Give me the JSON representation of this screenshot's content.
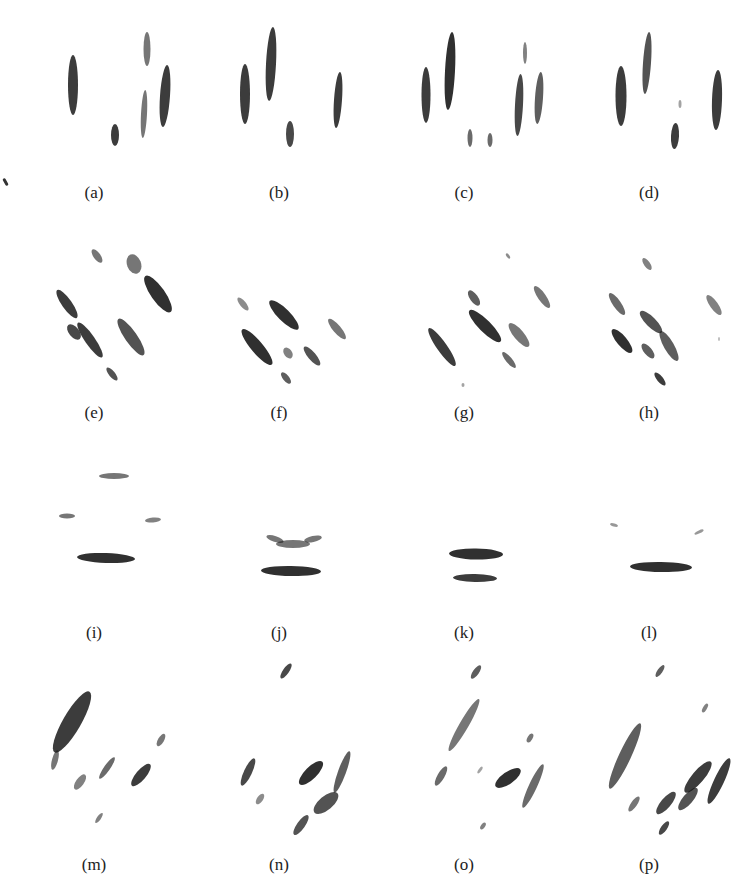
{
  "figure": {
    "panel_width": 184,
    "blob_color": "#1a1a1a",
    "panels": [
      {
        "label": "(a)",
        "col": 0,
        "row": 0,
        "caption_y": 183,
        "blobs": [
          {
            "cx": 63,
            "cy": 85,
            "rx": 5,
            "ry": 30,
            "rot": 0,
            "op": 0.85
          },
          {
            "cx": 105,
            "cy": 135,
            "rx": 4,
            "ry": 11,
            "rot": 0,
            "op": 0.85
          },
          {
            "cx": 137,
            "cy": 49,
            "rx": 3.5,
            "ry": 17,
            "rot": 0,
            "op": 0.6
          },
          {
            "cx": 134,
            "cy": 114,
            "rx": 3,
            "ry": 24,
            "rot": 3,
            "op": 0.6
          },
          {
            "cx": 155,
            "cy": 96,
            "rx": 5,
            "ry": 31,
            "rot": 4,
            "op": 0.85
          }
        ]
      },
      {
        "label": "(b)",
        "col": 1,
        "row": 0,
        "caption_y": 183,
        "blobs": [
          {
            "cx": 50,
            "cy": 94,
            "rx": 5,
            "ry": 30,
            "rot": 0,
            "op": 0.85
          },
          {
            "cx": 76,
            "cy": 64,
            "rx": 5,
            "ry": 37,
            "rot": 3,
            "op": 0.85
          },
          {
            "cx": 95,
            "cy": 134,
            "rx": 4,
            "ry": 13,
            "rot": 0,
            "op": 0.8
          },
          {
            "cx": 143,
            "cy": 100,
            "rx": 4,
            "ry": 28,
            "rot": 4,
            "op": 0.85
          }
        ]
      },
      {
        "label": "(c)",
        "col": 2,
        "row": 0,
        "caption_y": 183,
        "blobs": [
          {
            "cx": 46,
            "cy": 95,
            "rx": 4.5,
            "ry": 28,
            "rot": 0,
            "op": 0.85
          },
          {
            "cx": 70,
            "cy": 71,
            "rx": 5,
            "ry": 39,
            "rot": 3,
            "op": 0.9
          },
          {
            "cx": 90,
            "cy": 138,
            "rx": 2.5,
            "ry": 9,
            "rot": 0,
            "op": 0.65
          },
          {
            "cx": 110,
            "cy": 140,
            "rx": 2.5,
            "ry": 7,
            "rot": 0,
            "op": 0.65
          },
          {
            "cx": 145,
            "cy": 53,
            "rx": 2,
            "ry": 11,
            "rot": 0,
            "op": 0.55
          },
          {
            "cx": 139,
            "cy": 105,
            "rx": 4,
            "ry": 31,
            "rot": 3,
            "op": 0.8
          },
          {
            "cx": 159,
            "cy": 98,
            "rx": 4,
            "ry": 26,
            "rot": 4,
            "op": 0.7
          }
        ]
      },
      {
        "label": "(d)",
        "col": 3,
        "row": 0,
        "caption_y": 183,
        "blobs": [
          {
            "cx": 56,
            "cy": 96,
            "rx": 5.5,
            "ry": 30,
            "rot": 0,
            "op": 0.85
          },
          {
            "cx": 82,
            "cy": 63,
            "rx": 4,
            "ry": 31,
            "rot": 4,
            "op": 0.75
          },
          {
            "cx": 110,
            "cy": 136,
            "rx": 4,
            "ry": 13,
            "rot": 3,
            "op": 0.85
          },
          {
            "cx": 115,
            "cy": 104,
            "rx": 1.5,
            "ry": 4,
            "rot": 0,
            "op": 0.4
          },
          {
            "cx": 152,
            "cy": 100,
            "rx": 5,
            "ry": 30,
            "rot": 2,
            "op": 0.85
          }
        ]
      },
      {
        "label": "(e)",
        "col": 0,
        "row": 1,
        "caption_y": 403,
        "blobs": [
          {
            "cx": 87,
            "cy": 34,
            "rx": 3.5,
            "ry": 8,
            "rot": -35,
            "op": 0.6
          },
          {
            "cx": 124,
            "cy": 42,
            "rx": 7,
            "ry": 10,
            "rot": -20,
            "op": 0.6
          },
          {
            "cx": 148,
            "cy": 72,
            "rx": 7,
            "ry": 22,
            "rot": -35,
            "op": 0.9
          },
          {
            "cx": 57,
            "cy": 82,
            "rx": 5,
            "ry": 17,
            "rot": -35,
            "op": 0.85
          },
          {
            "cx": 80,
            "cy": 118,
            "rx": 5,
            "ry": 21,
            "rot": -35,
            "op": 0.85
          },
          {
            "cx": 64,
            "cy": 110,
            "rx": 5,
            "ry": 9,
            "rot": -40,
            "op": 0.8
          },
          {
            "cx": 121,
            "cy": 115,
            "rx": 6,
            "ry": 22,
            "rot": -35,
            "op": 0.75
          },
          {
            "cx": 102,
            "cy": 152,
            "rx": 3,
            "ry": 8,
            "rot": -40,
            "op": 0.75
          }
        ]
      },
      {
        "label": "(f)",
        "col": 1,
        "row": 1,
        "caption_y": 403,
        "blobs": [
          {
            "cx": 48,
            "cy": 82,
            "rx": 3,
            "ry": 8,
            "rot": -40,
            "op": 0.5
          },
          {
            "cx": 89,
            "cy": 93,
            "rx": 6,
            "ry": 20,
            "rot": -45,
            "op": 0.9
          },
          {
            "cx": 142,
            "cy": 107,
            "rx": 4,
            "ry": 13,
            "rot": -40,
            "op": 0.6
          },
          {
            "cx": 62,
            "cy": 125,
            "rx": 6,
            "ry": 23,
            "rot": -40,
            "op": 0.9
          },
          {
            "cx": 93,
            "cy": 131,
            "rx": 4,
            "ry": 6,
            "rot": -35,
            "op": 0.55
          },
          {
            "cx": 117,
            "cy": 134,
            "rx": 4,
            "ry": 12,
            "rot": -40,
            "op": 0.75
          },
          {
            "cx": 91,
            "cy": 156,
            "rx": 3,
            "ry": 7,
            "rot": -40,
            "op": 0.7
          }
        ]
      },
      {
        "label": "(g)",
        "col": 2,
        "row": 1,
        "caption_y": 403,
        "blobs": [
          {
            "cx": 128,
            "cy": 34,
            "rx": 1.5,
            "ry": 3,
            "rot": -35,
            "op": 0.5
          },
          {
            "cx": 94,
            "cy": 76,
            "rx": 4,
            "ry": 9,
            "rot": -35,
            "op": 0.7
          },
          {
            "cx": 105,
            "cy": 104,
            "rx": 6,
            "ry": 22,
            "rot": -45,
            "op": 0.9
          },
          {
            "cx": 162,
            "cy": 75,
            "rx": 4,
            "ry": 13,
            "rot": -35,
            "op": 0.6
          },
          {
            "cx": 62,
            "cy": 125,
            "rx": 5,
            "ry": 23,
            "rot": -35,
            "op": 0.85
          },
          {
            "cx": 139,
            "cy": 113,
            "rx": 5,
            "ry": 15,
            "rot": -40,
            "op": 0.6
          },
          {
            "cx": 129,
            "cy": 138,
            "rx": 3,
            "ry": 10,
            "rot": -40,
            "op": 0.65
          },
          {
            "cx": 83,
            "cy": 163,
            "rx": 1.5,
            "ry": 2,
            "rot": 0,
            "op": 0.4
          }
        ]
      },
      {
        "label": "(h)",
        "col": 3,
        "row": 1,
        "caption_y": 403,
        "blobs": [
          {
            "cx": 82,
            "cy": 42,
            "rx": 3,
            "ry": 7,
            "rot": -35,
            "op": 0.55
          },
          {
            "cx": 52,
            "cy": 82,
            "rx": 4,
            "ry": 13,
            "rot": -35,
            "op": 0.65
          },
          {
            "cx": 149,
            "cy": 83,
            "rx": 4,
            "ry": 12,
            "rot": -35,
            "op": 0.55
          },
          {
            "cx": 86,
            "cy": 100,
            "rx": 5,
            "ry": 15,
            "rot": -45,
            "op": 0.75
          },
          {
            "cx": 104,
            "cy": 124,
            "rx": 5,
            "ry": 17,
            "rot": -30,
            "op": 0.7
          },
          {
            "cx": 57,
            "cy": 119,
            "rx": 5,
            "ry": 15,
            "rot": -40,
            "op": 0.9
          },
          {
            "cx": 83,
            "cy": 129,
            "rx": 4,
            "ry": 9,
            "rot": -40,
            "op": 0.7
          },
          {
            "cx": 95,
            "cy": 157,
            "rx": 3,
            "ry": 8,
            "rot": -40,
            "op": 0.85
          },
          {
            "cx": 154,
            "cy": 117,
            "rx": 1,
            "ry": 2,
            "rot": 0,
            "op": 0.3
          }
        ]
      },
      {
        "label": "(i)",
        "col": 0,
        "row": 2,
        "caption_y": 623,
        "blobs": [
          {
            "cx": 104,
            "cy": 34,
            "rx": 15,
            "ry": 3,
            "rot": 0,
            "op": 0.6
          },
          {
            "cx": 57,
            "cy": 74,
            "rx": 8,
            "ry": 2.5,
            "rot": 0,
            "op": 0.6
          },
          {
            "cx": 143,
            "cy": 78,
            "rx": 8,
            "ry": 2.5,
            "rot": -5,
            "op": 0.55
          },
          {
            "cx": 96,
            "cy": 116,
            "rx": 29,
            "ry": 5,
            "rot": 2,
            "op": 0.9
          }
        ]
      },
      {
        "label": "(j)",
        "col": 1,
        "row": 2,
        "caption_y": 623,
        "blobs": [
          {
            "cx": 98,
            "cy": 102,
            "rx": 17,
            "ry": 4,
            "rot": 0,
            "op": 0.6
          },
          {
            "cx": 80,
            "cy": 97,
            "rx": 9,
            "ry": 3,
            "rot": 18,
            "op": 0.6
          },
          {
            "cx": 118,
            "cy": 97,
            "rx": 9,
            "ry": 3,
            "rot": -12,
            "op": 0.6
          },
          {
            "cx": 96,
            "cy": 129,
            "rx": 30,
            "ry": 5,
            "rot": 1,
            "op": 0.9
          }
        ]
      },
      {
        "label": "(k)",
        "col": 2,
        "row": 2,
        "caption_y": 623,
        "blobs": [
          {
            "cx": 96,
            "cy": 112,
            "rx": 27,
            "ry": 5.5,
            "rot": 1,
            "op": 0.9
          },
          {
            "cx": 95,
            "cy": 136,
            "rx": 22,
            "ry": 4,
            "rot": 1,
            "op": 0.85
          }
        ]
      },
      {
        "label": "(l)",
        "col": 3,
        "row": 2,
        "caption_y": 623,
        "blobs": [
          {
            "cx": 49,
            "cy": 83,
            "rx": 4,
            "ry": 1.5,
            "rot": 15,
            "op": 0.45
          },
          {
            "cx": 134,
            "cy": 90,
            "rx": 5,
            "ry": 1.5,
            "rot": -25,
            "op": 0.45
          },
          {
            "cx": 96,
            "cy": 125,
            "rx": 31,
            "ry": 5,
            "rot": 1,
            "op": 0.9
          }
        ]
      },
      {
        "label": "(m)",
        "col": 0,
        "row": 3,
        "caption_y": 855,
        "blobs": [
          {
            "cx": 62,
            "cy": 57,
            "rx": 9,
            "ry": 35,
            "rot": 30,
            "op": 0.85
          },
          {
            "cx": 45,
            "cy": 95,
            "rx": 3,
            "ry": 10,
            "rot": 15,
            "op": 0.6
          },
          {
            "cx": 151,
            "cy": 75,
            "rx": 3,
            "ry": 7,
            "rot": 30,
            "op": 0.6
          },
          {
            "cx": 97,
            "cy": 103,
            "rx": 3,
            "ry": 13,
            "rot": 35,
            "op": 0.65
          },
          {
            "cx": 131,
            "cy": 110,
            "rx": 5,
            "ry": 14,
            "rot": 40,
            "op": 0.85
          },
          {
            "cx": 70,
            "cy": 117,
            "rx": 4,
            "ry": 9,
            "rot": 35,
            "op": 0.55
          },
          {
            "cx": 89,
            "cy": 153,
            "rx": 2,
            "ry": 6,
            "rot": 35,
            "op": 0.55
          }
        ]
      },
      {
        "label": "(n)",
        "col": 1,
        "row": 3,
        "caption_y": 855,
        "blobs": [
          {
            "cx": 91,
            "cy": 6,
            "rx": 3,
            "ry": 9,
            "rot": 35,
            "op": 0.8
          },
          {
            "cx": 53,
            "cy": 107,
            "rx": 4,
            "ry": 15,
            "rot": 25,
            "op": 0.8
          },
          {
            "cx": 116,
            "cy": 108,
            "rx": 6,
            "ry": 16,
            "rot": 45,
            "op": 0.9
          },
          {
            "cx": 147,
            "cy": 107,
            "rx": 4,
            "ry": 22,
            "rot": 20,
            "op": 0.7
          },
          {
            "cx": 131,
            "cy": 138,
            "rx": 7,
            "ry": 15,
            "rot": 50,
            "op": 0.75
          },
          {
            "cx": 65,
            "cy": 134,
            "rx": 3,
            "ry": 6,
            "rot": 35,
            "op": 0.5
          },
          {
            "cx": 106,
            "cy": 160,
            "rx": 4,
            "ry": 12,
            "rot": 35,
            "op": 0.75
          }
        ]
      },
      {
        "label": "(o)",
        "col": 2,
        "row": 3,
        "caption_y": 855,
        "blobs": [
          {
            "cx": 96,
            "cy": 7,
            "rx": 3,
            "ry": 8,
            "rot": 35,
            "op": 0.7
          },
          {
            "cx": 84,
            "cy": 60,
            "rx": 4.5,
            "ry": 30,
            "rot": 30,
            "op": 0.6
          },
          {
            "cx": 150,
            "cy": 73,
            "rx": 2.5,
            "ry": 5,
            "rot": 30,
            "op": 0.6
          },
          {
            "cx": 61,
            "cy": 111,
            "rx": 3.5,
            "ry": 11,
            "rot": 30,
            "op": 0.65
          },
          {
            "cx": 100,
            "cy": 105,
            "rx": 1.5,
            "ry": 4,
            "rot": 35,
            "op": 0.4
          },
          {
            "cx": 128,
            "cy": 113,
            "rx": 6,
            "ry": 15,
            "rot": 55,
            "op": 0.9
          },
          {
            "cx": 153,
            "cy": 121,
            "rx": 4,
            "ry": 24,
            "rot": 25,
            "op": 0.65
          },
          {
            "cx": 103,
            "cy": 161,
            "rx": 2,
            "ry": 4,
            "rot": 35,
            "op": 0.55
          }
        ]
      },
      {
        "label": "(p)",
        "col": 3,
        "row": 3,
        "caption_y": 855,
        "blobs": [
          {
            "cx": 95,
            "cy": 6,
            "rx": 2.5,
            "ry": 7,
            "rot": 35,
            "op": 0.7
          },
          {
            "cx": 60,
            "cy": 91,
            "rx": 6,
            "ry": 36,
            "rot": 25,
            "op": 0.7
          },
          {
            "cx": 140,
            "cy": 43,
            "rx": 2,
            "ry": 5,
            "rot": 30,
            "op": 0.55
          },
          {
            "cx": 133,
            "cy": 112,
            "rx": 6,
            "ry": 20,
            "rot": 40,
            "op": 0.85
          },
          {
            "cx": 154,
            "cy": 116,
            "rx": 5,
            "ry": 25,
            "rot": 25,
            "op": 0.85
          },
          {
            "cx": 101,
            "cy": 138,
            "rx": 5,
            "ry": 14,
            "rot": 40,
            "op": 0.8
          },
          {
            "cx": 123,
            "cy": 134,
            "rx": 5,
            "ry": 14,
            "rot": 40,
            "op": 0.75
          },
          {
            "cx": 69,
            "cy": 139,
            "rx": 3,
            "ry": 9,
            "rot": 35,
            "op": 0.6
          },
          {
            "cx": 99,
            "cy": 163,
            "rx": 3,
            "ry": 8,
            "rot": 35,
            "op": 0.8
          }
        ]
      }
    ]
  }
}
